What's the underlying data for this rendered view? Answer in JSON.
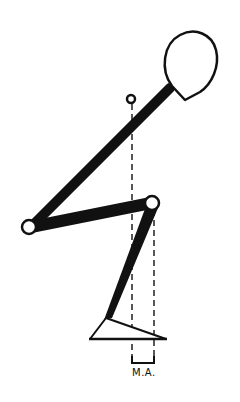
{
  "diagram": {
    "type": "biomechanical-stick-figure",
    "colors": {
      "ink": "#111111",
      "background": "#ffffff"
    },
    "segments": [
      {
        "name": "trunk",
        "from": [
          32,
          226
        ],
        "to": [
          178,
          82
        ]
      },
      {
        "name": "thigh",
        "from": [
          32,
          226
        ],
        "to": [
          152,
          203
        ]
      },
      {
        "name": "shank",
        "from": [
          152,
          203
        ],
        "to": [
          107,
          318
        ]
      }
    ],
    "joints": [
      {
        "name": "hip",
        "x": 29,
        "y": 227,
        "r": 7
      },
      {
        "name": "knee",
        "x": 152,
        "y": 203,
        "r": 7
      },
      {
        "name": "center-of-mass",
        "x": 131,
        "y": 99,
        "r": 4
      }
    ],
    "head": {
      "cx": 188,
      "cy": 64
    },
    "foot": {
      "points": [
        [
          90,
          339
        ],
        [
          107,
          318
        ],
        [
          165,
          339
        ]
      ]
    },
    "moment_arm": {
      "line1_x": 132,
      "line2_x": 154,
      "label": "M.A."
    }
  }
}
